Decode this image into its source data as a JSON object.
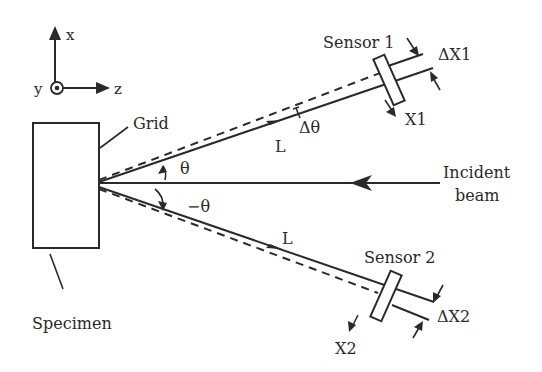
{
  "figure": {
    "type": "schematic"
  },
  "axes": {
    "x_label": "x",
    "y_label": "y",
    "z_label": "z"
  },
  "labels": {
    "grid": "Grid",
    "specimen": "Specimen",
    "incident_beam_line1": "Incident",
    "incident_beam_line2": "beam",
    "theta": "θ",
    "neg_theta": "−θ",
    "delta_theta": "Δθ",
    "length_upper": "L",
    "length_lower": "L",
    "sensor1": "Sensor 1",
    "sensor2": "Sensor 2",
    "delta_x1": "ΔX1",
    "delta_x2": "ΔX2",
    "x1": "X1",
    "x2": "X2"
  },
  "colors": {
    "stroke": "#2a2a2a",
    "background": "#ffffff"
  }
}
